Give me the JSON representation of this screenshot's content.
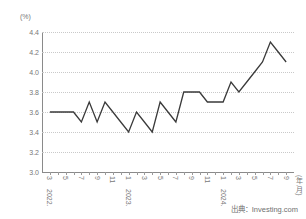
{
  "chart_data": {
    "type": "line",
    "title": "",
    "subtitle": "",
    "unit_label": "(%)",
    "xlabel": "(年,月)",
    "ylabel": "",
    "ylim": [
      3.0,
      4.4
    ],
    "yticks": [
      "3.0",
      "3.2",
      "3.4",
      "3.6",
      "3.8",
      "4.0",
      "4.2",
      "4.4"
    ],
    "grid": true,
    "legend": "none",
    "x": [
      "2022.3",
      "2022.4",
      "2022.5",
      "2022.6",
      "2022.7",
      "2022.8",
      "2022.9",
      "2022.10",
      "2022.11",
      "2022.12",
      "2023.1",
      "2023.2",
      "2023.3",
      "2023.4",
      "2023.5",
      "2023.6",
      "2023.7",
      "2023.8",
      "2023.9",
      "2023.10",
      "2023.11",
      "2023.12",
      "2024.1",
      "2024.2",
      "2024.3",
      "2024.4",
      "2024.5",
      "2024.6",
      "2024.7",
      "2024.8",
      "2024.9"
    ],
    "values": [
      3.6,
      3.6,
      3.6,
      3.6,
      3.5,
      3.7,
      3.5,
      3.7,
      3.6,
      3.5,
      3.4,
      3.6,
      3.5,
      3.4,
      3.7,
      3.6,
      3.5,
      3.8,
      3.8,
      3.8,
      3.7,
      3.7,
      3.7,
      3.9,
      3.8,
      3.9,
      4.0,
      4.1,
      4.3,
      4.2,
      4.1
    ],
    "xtick_labels": [
      {
        "x": "2022.3",
        "month": "3",
        "year": "2022."
      },
      {
        "x": "2022.5",
        "month": "5",
        "year": ""
      },
      {
        "x": "2022.7",
        "month": "7",
        "year": ""
      },
      {
        "x": "2022.9",
        "month": "9",
        "year": ""
      },
      {
        "x": "2022.11",
        "month": "11",
        "year": ""
      },
      {
        "x": "2023.1",
        "month": "1",
        "year": "2023."
      },
      {
        "x": "2023.3",
        "month": "3",
        "year": ""
      },
      {
        "x": "2023.5",
        "month": "5",
        "year": ""
      },
      {
        "x": "2023.7",
        "month": "7",
        "year": ""
      },
      {
        "x": "2023.9",
        "month": "9",
        "year": ""
      },
      {
        "x": "2023.11",
        "month": "11",
        "year": ""
      },
      {
        "x": "2024.1",
        "month": "1",
        "year": "2024."
      },
      {
        "x": "2024.3",
        "month": "3",
        "year": ""
      },
      {
        "x": "2024.5",
        "month": "5",
        "year": ""
      },
      {
        "x": "2024.7",
        "month": "7",
        "year": ""
      },
      {
        "x": "2024.9",
        "month": "9",
        "year": ""
      }
    ],
    "line_color": "#3a3a3a"
  },
  "footer": {
    "source": "出典：Investing.com"
  }
}
